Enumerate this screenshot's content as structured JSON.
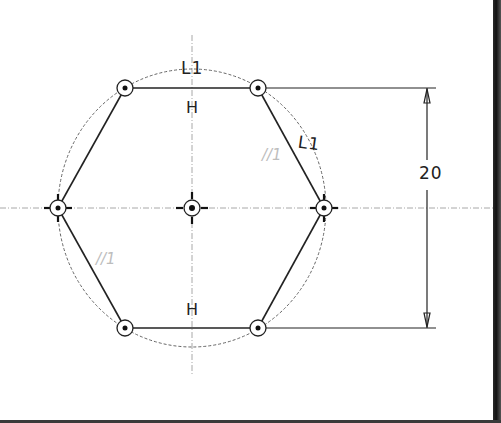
{
  "sketch": {
    "shape": "hexagon",
    "center": {
      "x": 192,
      "y": 208
    },
    "vertices": [
      {
        "id": "top-left",
        "x": 125,
        "y": 88
      },
      {
        "id": "top-right",
        "x": 258,
        "y": 88
      },
      {
        "id": "right",
        "x": 324,
        "y": 208
      },
      {
        "id": "bottom-right",
        "x": 258,
        "y": 328
      },
      {
        "id": "bottom-left",
        "x": 125,
        "y": 328
      },
      {
        "id": "left",
        "x": 58,
        "y": 208
      }
    ],
    "construction_circle_radius": 134
  },
  "constraints": {
    "top_horizontal": "H",
    "bottom_horizontal": "H",
    "equal_length_top": "L1",
    "equal_length_right": "L1",
    "parallel_right": "//1",
    "parallel_left": "//1"
  },
  "dimension": {
    "value": "20",
    "orientation": "vertical"
  },
  "colors": {
    "geometry": "#222222",
    "construction": "#777777",
    "centerline": "#999999",
    "faint_constraint": "#bdbdbd",
    "background": "#ffffff"
  }
}
